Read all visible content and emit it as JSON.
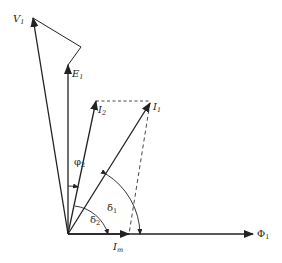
{
  "diagram": {
    "type": "phasor-diagram",
    "origin": [
      68,
      234
    ],
    "colors": {
      "ink": "#222222",
      "background": "#ffffff"
    },
    "vectors": [
      {
        "id": "V1",
        "label": "V",
        "subscript": "1",
        "tip": [
          33,
          18
        ]
      },
      {
        "id": "E1",
        "label": "E",
        "subscript": "1",
        "tip": [
          68,
          65
        ]
      },
      {
        "id": "I2",
        "label": "I",
        "subscript": "2",
        "tip": [
          96,
          101
        ]
      },
      {
        "id": "I1",
        "label": "I",
        "subscript": "1",
        "tip": [
          150,
          103
        ]
      },
      {
        "id": "Im",
        "label": "I",
        "subscript": "m",
        "tip": [
          129,
          234
        ]
      },
      {
        "id": "Phi1",
        "label": "Φ",
        "subscript": "1",
        "tip": [
          253,
          234
        ]
      }
    ],
    "angles": [
      {
        "id": "phi2",
        "label": "φ",
        "subscript": "2"
      },
      {
        "id": "delta1",
        "label": "δ",
        "subscript": "1"
      },
      {
        "id": "delta2",
        "label": "δ",
        "subscript": "2"
      }
    ]
  }
}
